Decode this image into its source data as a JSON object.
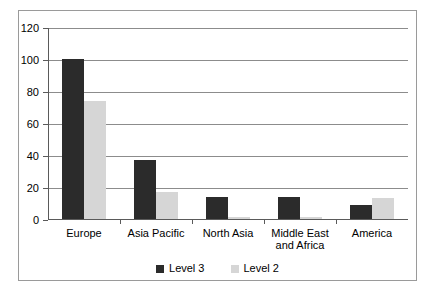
{
  "chart_data": {
    "type": "bar",
    "title": "",
    "subtitle": "",
    "xlabel": "",
    "ylabel": "",
    "ylim": [
      0,
      120
    ],
    "yticks": [
      0,
      20,
      40,
      60,
      80,
      100,
      120
    ],
    "ytick_labels": [
      "0",
      "20",
      "40",
      "60",
      "80",
      "100",
      "120"
    ],
    "grid": "horizontal",
    "legend_position": "bottom-center",
    "categories": [
      "Europe",
      "Asia Pacific",
      "North Asia",
      "Middle East\nand Africa",
      "America"
    ],
    "series": [
      {
        "name": "Level 3",
        "color": "#2b2b2b",
        "values": [
          100,
          37,
          13.5,
          13.5,
          8.5
        ]
      },
      {
        "name": "Level 2",
        "color": "#d6d6d6",
        "values": [
          74,
          17,
          1.5,
          1,
          13
        ]
      }
    ]
  },
  "legend": {
    "items": [
      {
        "label": "Level 3",
        "color": "#2b2b2b"
      },
      {
        "label": "Level 2",
        "color": "#d6d6d6"
      }
    ]
  },
  "style": {
    "figure_background": "#ffffff",
    "figure_border": "#9a9a9a",
    "axis_color": "#5a5a5a",
    "gridline_color": "#8c8c8c",
    "text_color": "#000000"
  }
}
